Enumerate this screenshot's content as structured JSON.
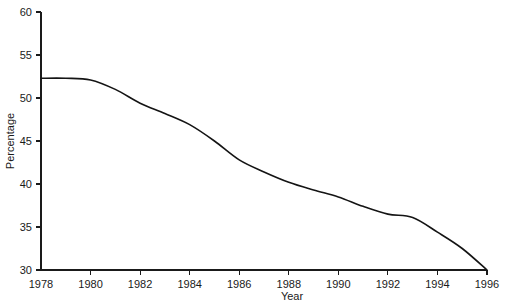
{
  "chart_data": {
    "type": "line",
    "title": "",
    "xlabel": "Year",
    "ylabel": "Percentage",
    "xlim": [
      1978,
      1996
    ],
    "ylim": [
      30,
      60
    ],
    "grid": false,
    "legend": false,
    "xticks": [
      1978,
      1980,
      1982,
      1984,
      1986,
      1988,
      1990,
      1992,
      1994,
      1996
    ],
    "xtick_labels": [
      "1978",
      "1980",
      "1982",
      "1984",
      "1986",
      "1988",
      "1990",
      "1992",
      "1994",
      "1996"
    ],
    "yticks": [
      30,
      35,
      40,
      45,
      50,
      55,
      60
    ],
    "ytick_labels": [
      "30",
      "35",
      "40",
      "45",
      "50",
      "55",
      "60"
    ],
    "series": [
      {
        "name": "Percentage",
        "color": "#141414",
        "x": [
          1978,
          1979,
          1980,
          1981,
          1982,
          1983,
          1984,
          1985,
          1986,
          1987,
          1988,
          1989,
          1990,
          1991,
          1992,
          1993,
          1994,
          1995,
          1996
        ],
        "values": [
          52.3,
          52.3,
          52.1,
          51.0,
          49.4,
          48.2,
          46.9,
          45.0,
          42.8,
          41.4,
          40.2,
          39.3,
          38.5,
          37.4,
          36.5,
          36.1,
          34.4,
          32.5,
          30.0
        ]
      }
    ]
  },
  "axes": {
    "x_title": "Year",
    "y_title": "Percentage"
  }
}
